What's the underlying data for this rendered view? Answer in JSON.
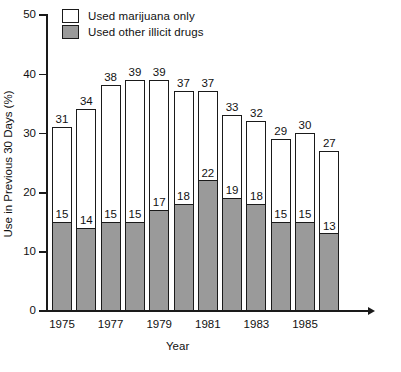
{
  "chart_data": {
    "type": "bar",
    "subtype": "stacked-vertical",
    "title": "",
    "xlabel": "Year",
    "ylabel": "Use in Previous 30 Days (%)",
    "ylim": [
      0,
      50
    ],
    "yticks": [
      0,
      10,
      20,
      30,
      40,
      50
    ],
    "grid": false,
    "legend_position": "top-left",
    "categories": [
      "1975",
      "1976",
      "1977",
      "1978",
      "1979",
      "1980",
      "1981",
      "1982",
      "1983",
      "1984",
      "1985",
      "1986"
    ],
    "xtick_labels": [
      "1975",
      "",
      "1977",
      "",
      "1979",
      "",
      "1981",
      "",
      "1983",
      "",
      "1985",
      ""
    ],
    "series": [
      {
        "name": "Used other illicit drugs",
        "color": "#9a9a9a",
        "values": [
          15,
          14,
          15,
          15,
          17,
          18,
          22,
          19,
          18,
          15,
          15,
          13
        ]
      },
      {
        "name": "Used marijuana only",
        "color": "#ffffff",
        "values": [
          16,
          20,
          23,
          24,
          22,
          19,
          15,
          14,
          14,
          14,
          15,
          14
        ]
      }
    ],
    "totals": [
      31,
      34,
      38,
      39,
      39,
      37,
      37,
      33,
      32,
      29,
      30,
      27
    ],
    "total_labels": [
      "31",
      "34",
      "38",
      "39",
      "39",
      "37",
      "37",
      "33",
      "32",
      "29",
      "30",
      "27"
    ],
    "gray_labels": [
      "15",
      "14",
      "15",
      "15",
      "17",
      "18",
      "22",
      "19",
      "18",
      "15",
      "15",
      "13"
    ]
  },
  "legend": {
    "items": [
      {
        "label": "Used marijuana only",
        "swatch": "white"
      },
      {
        "label": "Used other illicit drugs",
        "swatch": "gray"
      }
    ]
  },
  "colors": {
    "gray_segment": "#9a9a9a",
    "white_segment": "#ffffff",
    "axis": "#1a1a1a",
    "background": "#ffffff"
  }
}
